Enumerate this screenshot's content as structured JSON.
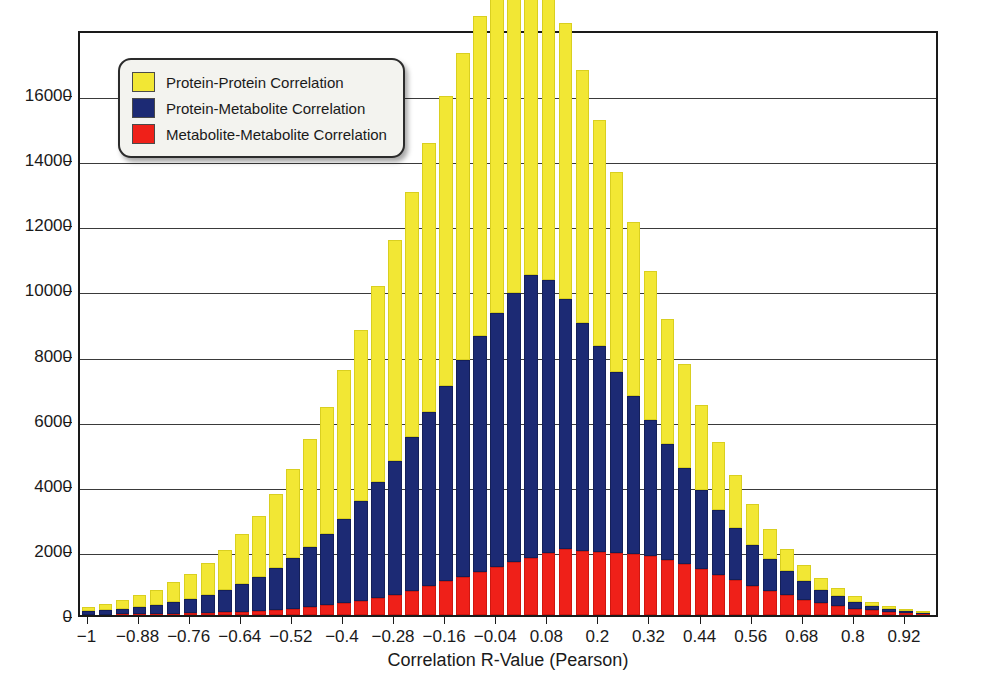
{
  "chart_data": {
    "type": "bar",
    "stacked": true,
    "title": "",
    "xlabel": "Correlation R-Value (Pearson)",
    "ylabel": "",
    "grid": true,
    "legend_position": "top-left",
    "ylim": [
      0,
      18000
    ],
    "xlim": [
      -1.02,
      1.0
    ],
    "bin_width": 0.04,
    "y_ticks": [
      0,
      2000,
      4000,
      6000,
      8000,
      10000,
      12000,
      14000,
      16000
    ],
    "y_tick_labels": [
      "0",
      "2000",
      "4000",
      "6000",
      "8000",
      "10000",
      "12000",
      "14000",
      "16000"
    ],
    "x_ticks": [
      -1,
      -0.88,
      -0.76,
      -0.64,
      -0.52,
      -0.4,
      -0.28,
      -0.16,
      -0.04,
      0.08,
      0.2,
      0.32,
      0.44,
      0.56,
      0.68,
      0.8,
      0.92
    ],
    "x_tick_labels": [
      "−1",
      "−0.88",
      "−0.76",
      "−0.64",
      "−0.52",
      "−0.4",
      "−0.28",
      "−0.16",
      "−0.04",
      "0.08",
      "0.2",
      "0.32",
      "0.44",
      "0.56",
      "0.68",
      "0.8",
      "0.92"
    ],
    "bin_centers": [
      -1.0,
      -0.96,
      -0.92,
      -0.88,
      -0.84,
      -0.8,
      -0.76,
      -0.72,
      -0.68,
      -0.64,
      -0.6,
      -0.56,
      -0.52,
      -0.48,
      -0.44,
      -0.4,
      -0.36,
      -0.32,
      -0.28,
      -0.24,
      -0.2,
      -0.16,
      -0.12,
      -0.08,
      -0.04,
      0.0,
      0.04,
      0.08,
      0.12,
      0.16,
      0.2,
      0.24,
      0.28,
      0.32,
      0.36,
      0.4,
      0.44,
      0.48,
      0.52,
      0.56,
      0.6,
      0.64,
      0.68,
      0.72,
      0.76,
      0.8,
      0.84,
      0.88,
      0.92,
      0.96
    ],
    "series": [
      {
        "name": "Metabolite-Metabolite Correlation",
        "color": "#ef2019",
        "values": [
          10,
          15,
          20,
          25,
          30,
          40,
          50,
          60,
          80,
          100,
          130,
          160,
          200,
          250,
          300,
          360,
          430,
          520,
          620,
          740,
          880,
          1040,
          1180,
          1320,
          1480,
          1620,
          1760,
          1900,
          2020,
          1980,
          1950,
          1900,
          1880,
          1820,
          1700,
          1560,
          1400,
          1240,
          1080,
          900,
          740,
          600,
          470,
          360,
          270,
          200,
          140,
          95,
          60,
          30
        ]
      },
      {
        "name": "Protein-Metabolite Correlation",
        "color": "#1c2a74",
        "values": [
          120,
          150,
          180,
          230,
          290,
          360,
          450,
          560,
          700,
          860,
          1050,
          1280,
          1540,
          1850,
          2200,
          2600,
          3060,
          3560,
          4120,
          4720,
          5350,
          6000,
          6650,
          7250,
          7800,
          8280,
          8680,
          8380,
          7680,
          7000,
          6300,
          5580,
          4860,
          4180,
          3540,
          2960,
          2440,
          1980,
          1580,
          1250,
          970,
          740,
          560,
          410,
          300,
          215,
          150,
          100,
          65,
          35
        ]
      },
      {
        "name": "Protein-Protein Correlation",
        "color": "#f2e734",
        "values": [
          110,
          175,
          250,
          345,
          460,
          600,
          770,
          980,
          1220,
          1520,
          1870,
          2280,
          2760,
          3300,
          3900,
          4560,
          5260,
          6020,
          6790,
          7540,
          8270,
          8900,
          9420,
          9830,
          10100,
          10150,
          9800,
          9220,
          8500,
          7760,
          6950,
          6140,
          5340,
          4580,
          3860,
          3200,
          2600,
          2080,
          1630,
          1250,
          940,
          700,
          510,
          370,
          260,
          180,
          125,
          85,
          55,
          30
        ]
      }
    ],
    "stack_totals": [
      240,
      340,
      450,
      600,
      780,
      1000,
      1270,
      1600,
      2000,
      2480,
      3050,
      3720,
      4500,
      5400,
      6400,
      7520,
      8750,
      10100,
      11530,
      13000,
      14500,
      15940,
      17250,
      18400,
      19380,
      20050,
      20240,
      19500,
      18200,
      16740,
      15200,
      13620,
      12080,
      10580,
      9100,
      7720,
      6440,
      5300,
      4290,
      3400,
      2650,
      2040,
      1540,
      1140,
      830,
      595,
      415,
      280,
      180,
      95
    ]
  },
  "legend": {
    "items": [
      {
        "label": "Protein-Protein Correlation",
        "color": "#f2e734",
        "swatch_class": "sw-yellow"
      },
      {
        "label": "Protein-Metabolite Correlation",
        "color": "#1c2a74",
        "swatch_class": "sw-blue"
      },
      {
        "label": "Metabolite-Metabolite Correlation",
        "color": "#ef2019",
        "swatch_class": "sw-red"
      }
    ]
  },
  "axes": {
    "x_title": "Correlation R-Value (Pearson)"
  }
}
